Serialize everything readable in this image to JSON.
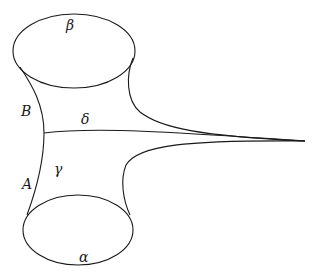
{
  "diagram": {
    "type": "topological surface (pair of pants with cusp)",
    "labels": {
      "beta": "β",
      "alpha": "α",
      "delta": "δ",
      "gamma": "γ",
      "B": "B",
      "A": "A"
    },
    "elements": {
      "top_boundary_curve": "β",
      "bottom_boundary_curve": "α",
      "arc_to_cusp": "δ",
      "left_side_upper_segment": "B",
      "left_side_lower_segment": "A",
      "interior_region_label": "γ"
    },
    "stroke_color": "#1a1a1a",
    "background_color": "#ffffff"
  }
}
